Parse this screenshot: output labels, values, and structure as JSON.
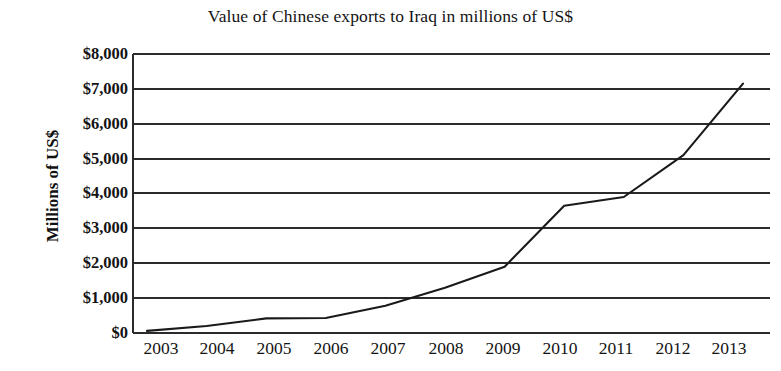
{
  "chart_data": {
    "type": "line",
    "title": "Value of Chinese exports to Iraq in millions of US$",
    "xlabel": "",
    "ylabel": "Millions of US$",
    "categories": [
      "2003",
      "2004",
      "2005",
      "2006",
      "2007",
      "2008",
      "2009",
      "2010",
      "2011",
      "2012",
      "2013"
    ],
    "x": [
      2003,
      2004,
      2005,
      2006,
      2007,
      2008,
      2009,
      2010,
      2011,
      2012,
      2013
    ],
    "values": [
      60,
      200,
      420,
      430,
      780,
      1300,
      1900,
      3650,
      3900,
      5100,
      7150
    ],
    "ylim": [
      0,
      8000
    ],
    "ytick_values": [
      0,
      1000,
      2000,
      3000,
      4000,
      5000,
      6000,
      7000,
      8000
    ],
    "ytick_labels": [
      "$0",
      "$1,000",
      "$2,000",
      "$3,000",
      "$4,000",
      "$5,000",
      "$6,000",
      "$7,000",
      "$8,000"
    ],
    "grid": "horizontal",
    "legend": null,
    "series_color": "#1a1a1a",
    "gridline_color": "#2b2b2b",
    "background_color": "#ffffff"
  }
}
